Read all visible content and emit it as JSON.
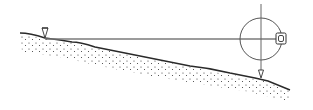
{
  "diagram": {
    "colors": {
      "background": "#ffffff",
      "ground_line": "#2a2a2a",
      "ground_dots": "#3a3a3a",
      "sight_line": "#7a7a7a",
      "circle": "#555555",
      "plumb_line": "#666666",
      "instrument": "#333333"
    },
    "elements": {
      "ground_peg": {
        "x": 45,
        "y": 38,
        "label": ""
      },
      "sight_line": {
        "x1": 45,
        "y1": 39,
        "x2": 276,
        "y2": 39
      },
      "circle": {
        "cx": 261,
        "cy": 39,
        "r": 21
      },
      "plumb_line": {
        "x": 261,
        "y1": 4,
        "y2": 76
      },
      "plumb_bob": {
        "x": 261,
        "y": 76
      },
      "instrument_box": {
        "x": 277,
        "y": 33,
        "w": 9,
        "h": 11
      }
    }
  }
}
